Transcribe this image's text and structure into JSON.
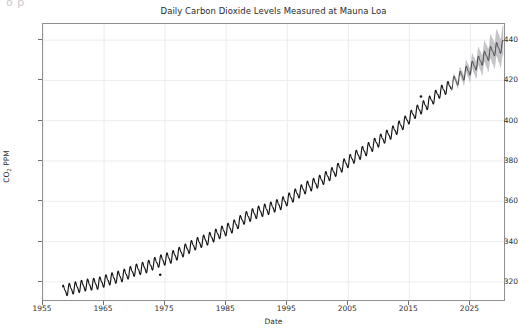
{
  "figure": {
    "ghost_text": "o  p",
    "background_color": "#ffffff",
    "frame_color": "#8f8f96",
    "grid_color": "#ececf0",
    "observed_color": "#141414",
    "forecast_line_color": "#3a3a3a",
    "forecast_band_color": "#c4c4c8"
  },
  "chart_data": {
    "type": "line",
    "title": "Daily Carbon Dioxide Levels Measured at Mauna Loa",
    "xlabel": "Date",
    "ylabel": "CO₂ PPM",
    "ylabel_plain": "CO2 PPM",
    "grid": true,
    "legend": null,
    "xlim": [
      1955,
      2030.5
    ],
    "ylim": [
      311,
      448
    ],
    "xticks": [
      1955,
      1965,
      1975,
      1985,
      1995,
      2005,
      2015,
      2025
    ],
    "xtick_labels": [
      "1955",
      "1965",
      "1975",
      "1985",
      "1995",
      "2005",
      "2015",
      "2025"
    ],
    "yticks": [
      320,
      340,
      360,
      380,
      400,
      420,
      440
    ],
    "ytick_labels": [
      "320",
      "340",
      "360",
      "380",
      "400",
      "420",
      "440"
    ],
    "series": [
      {
        "name": "observed",
        "style": "dense sawtooth seasonal cycle on rising trend",
        "color": "#141414",
        "x_range": [
          1958.2,
          2021.8
        ],
        "seasonal_amplitude_ppm": 3.2,
        "seasonal_period_years": 1.0,
        "annual_trend": [
          {
            "year": 1958,
            "ppm": 315.3
          },
          {
            "year": 1960,
            "ppm": 316.9
          },
          {
            "year": 1962,
            "ppm": 318.4
          },
          {
            "year": 1964,
            "ppm": 319.2
          },
          {
            "year": 1966,
            "ppm": 321.4
          },
          {
            "year": 1968,
            "ppm": 323.0
          },
          {
            "year": 1970,
            "ppm": 325.7
          },
          {
            "year": 1972,
            "ppm": 327.4
          },
          {
            "year": 1974,
            "ppm": 330.2
          },
          {
            "year": 1976,
            "ppm": 332.2
          },
          {
            "year": 1978,
            "ppm": 335.4
          },
          {
            "year": 1980,
            "ppm": 338.8
          },
          {
            "year": 1982,
            "ppm": 341.2
          },
          {
            "year": 1984,
            "ppm": 344.4
          },
          {
            "year": 1986,
            "ppm": 347.2
          },
          {
            "year": 1988,
            "ppm": 351.6
          },
          {
            "year": 1990,
            "ppm": 354.4
          },
          {
            "year": 1992,
            "ppm": 356.4
          },
          {
            "year": 1994,
            "ppm": 358.8
          },
          {
            "year": 1996,
            "ppm": 362.6
          },
          {
            "year": 1998,
            "ppm": 366.7
          },
          {
            "year": 2000,
            "ppm": 369.5
          },
          {
            "year": 2002,
            "ppm": 373.2
          },
          {
            "year": 2004,
            "ppm": 377.5
          },
          {
            "year": 2006,
            "ppm": 381.9
          },
          {
            "year": 2008,
            "ppm": 385.6
          },
          {
            "year": 2010,
            "ppm": 389.9
          },
          {
            "year": 2012,
            "ppm": 393.8
          },
          {
            "year": 2014,
            "ppm": 398.6
          },
          {
            "year": 2016,
            "ppm": 404.2
          },
          {
            "year": 2018,
            "ppm": 408.5
          },
          {
            "year": 2020,
            "ppm": 414.2
          },
          {
            "year": 2021.8,
            "ppm": 417.5
          }
        ],
        "outliers": [
          {
            "year": 1974.2,
            "ppm": 323.5
          },
          {
            "year": 2016.9,
            "ppm": 412.0
          }
        ]
      },
      {
        "name": "forecast",
        "style": "sawtooth seasonal cycle with widening uncertainty band",
        "line_color": "#3a3a3a",
        "band_color": "#c4c4c8",
        "x_range": [
          2021.8,
          2030.4
        ],
        "seasonal_amplitude_ppm": 3.4,
        "annual_trend": [
          {
            "year": 2022,
            "ppm": 418.4
          },
          {
            "year": 2023,
            "ppm": 420.8
          },
          {
            "year": 2024,
            "ppm": 423.3
          },
          {
            "year": 2025,
            "ppm": 425.8
          },
          {
            "year": 2026,
            "ppm": 428.3
          },
          {
            "year": 2027,
            "ppm": 430.7
          },
          {
            "year": 2028,
            "ppm": 433.1
          },
          {
            "year": 2029,
            "ppm": 435.4
          },
          {
            "year": 2030.4,
            "ppm": 437.0
          }
        ],
        "band_halfwidth_start_ppm": 0.6,
        "band_halfwidth_end_ppm": 7.5
      }
    ]
  }
}
